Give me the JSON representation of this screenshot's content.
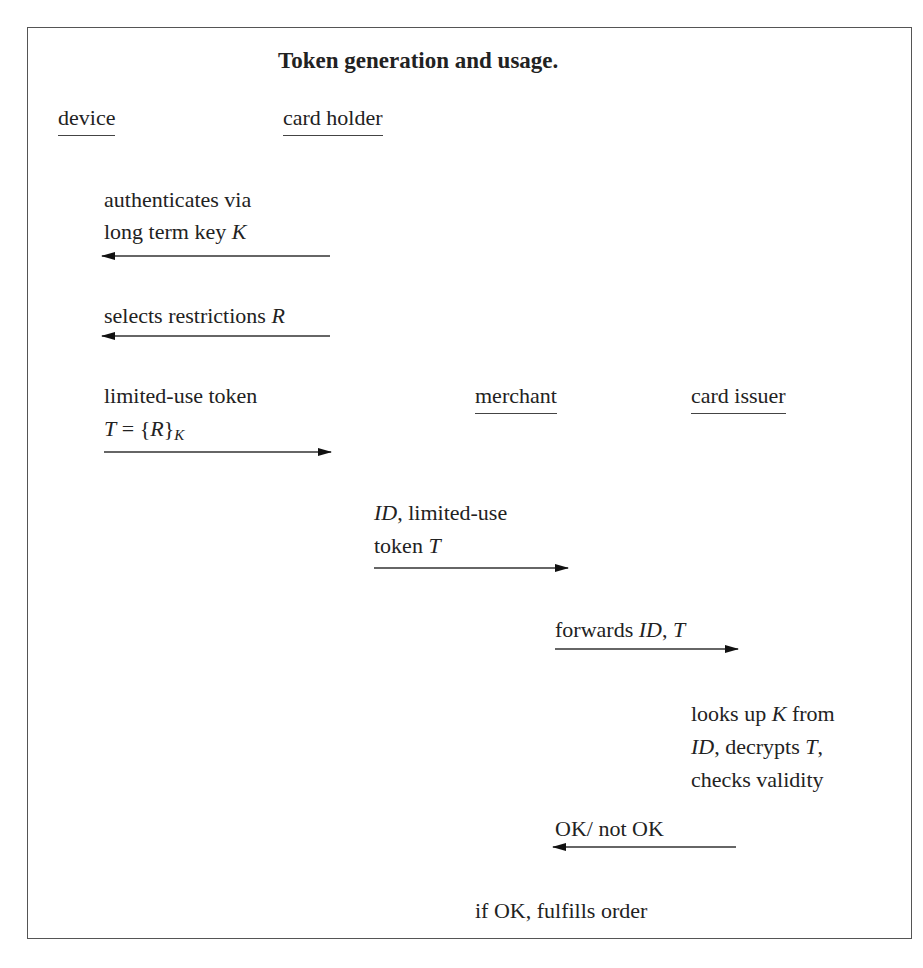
{
  "title": "Token generation and usage.",
  "actors": {
    "device": "device",
    "card_holder": "card holder",
    "merchant": "merchant",
    "card_issuer": "card issuer"
  },
  "messages": [
    {
      "id": "m1",
      "line1": "authenticates via",
      "line2_prefix": "long term key ",
      "line2_var": "K",
      "direction": "left",
      "from": "card holder",
      "to": "device"
    },
    {
      "id": "m2",
      "line1_prefix": "selects restrictions ",
      "line1_var": "R",
      "direction": "left",
      "from": "card holder",
      "to": "device"
    },
    {
      "id": "m3",
      "line1": "limited-use token",
      "line2_var": "T",
      "line2_mid": " = {",
      "line2_var2": "R",
      "line2_close": "}",
      "line2_sub": "K",
      "direction": "right",
      "from": "device",
      "to": "card holder"
    },
    {
      "id": "m4",
      "line1_var": "ID",
      "line1_suffix": ", limited-use",
      "line2_prefix": "token ",
      "line2_var": "T",
      "direction": "right",
      "from": "card holder",
      "to": "merchant"
    },
    {
      "id": "m5",
      "line1_prefix": "forwards ",
      "line1_var": "ID",
      "line1_mid": ", ",
      "line1_var2": "T",
      "direction": "right",
      "from": "merchant",
      "to": "card issuer"
    },
    {
      "id": "m7",
      "line1": "OK/ not OK",
      "direction": "left",
      "from": "card issuer",
      "to": "merchant"
    }
  ],
  "notes": {
    "issuer_check": {
      "line1_prefix": "looks up ",
      "line1_var": "K",
      "line1_suffix": " from",
      "line2_var": "ID",
      "line2_mid": ", decrypts ",
      "line2_var2": "T",
      "line2_suffix": ",",
      "line3": "checks validity"
    },
    "merchant_final": "if OK, fulfills order"
  }
}
